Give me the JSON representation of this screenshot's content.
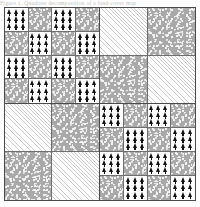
{
  "caption": {
    "text": "Figure 1.  Quadtree decomposition of a land-cover map"
  },
  "figure": {
    "title": "Quadtree decomposition",
    "outer_border_color": "#4a4a4a",
    "cell_border_color": "#6f6f6f",
    "background_color": "#ffffff",
    "legend_colors": {
      "stipple": "#a9a9a9",
      "hatch": "#c9c9c9",
      "trees_ground": "#ffffff",
      "trees_glyph": "#111111"
    },
    "pattern_names": {
      "trees": "forest-pattern",
      "stipple": "stipple-pattern",
      "hatch": "hatch-pattern",
      "hatch_dark": "dark-hatch-pattern"
    },
    "quadrants": [
      {
        "id": "top-left",
        "name": "quadrant-top-left",
        "subdivision": "4x4",
        "depth": 2,
        "cells": [
          "trees",
          "stipple",
          "trees",
          "stipple",
          "stipple",
          "trees",
          "stipple",
          "trees",
          "trees",
          "stipple",
          "trees",
          "stipple",
          "stipple",
          "trees",
          "stipple",
          "trees"
        ]
      },
      {
        "id": "top-right",
        "name": "quadrant-top-right",
        "subdivision": "2x2",
        "depth": 1,
        "cells": [
          "hatch",
          "stipple",
          "stipple",
          "hatch"
        ]
      },
      {
        "id": "bottom-left",
        "name": "quadrant-bottom-left",
        "subdivision": "2x2",
        "depth": 1,
        "cells": [
          "hatch",
          "stipple",
          "stipple",
          "hatch"
        ]
      },
      {
        "id": "bottom-right",
        "name": "quadrant-bottom-right",
        "subdivision": "4x4",
        "depth": 2,
        "cells": [
          "trees",
          "stipple",
          "trees",
          "stipple",
          "stipple",
          "trees",
          "stipple",
          "trees",
          "trees",
          "stipple",
          "trees",
          "stipple",
          "stipple",
          "trees",
          "stipple",
          "trees"
        ]
      }
    ]
  }
}
